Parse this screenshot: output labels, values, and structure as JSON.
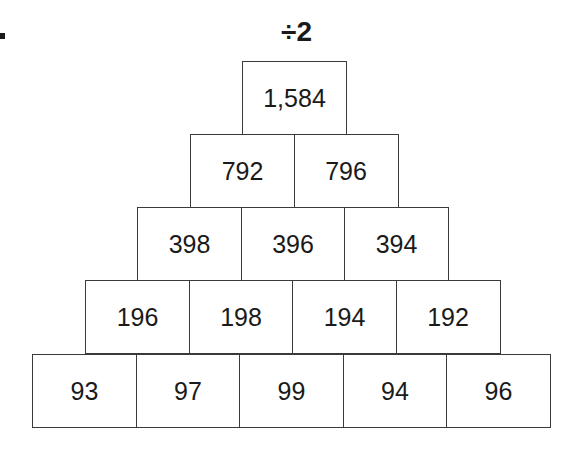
{
  "problem": {
    "operation_label": "÷2",
    "rows": [
      [
        "1,584"
      ],
      [
        "792",
        "796"
      ],
      [
        "398",
        "396",
        "394"
      ],
      [
        "196",
        "198",
        "194",
        "192"
      ],
      [
        "93",
        "97",
        "99",
        "94",
        "96"
      ]
    ]
  }
}
